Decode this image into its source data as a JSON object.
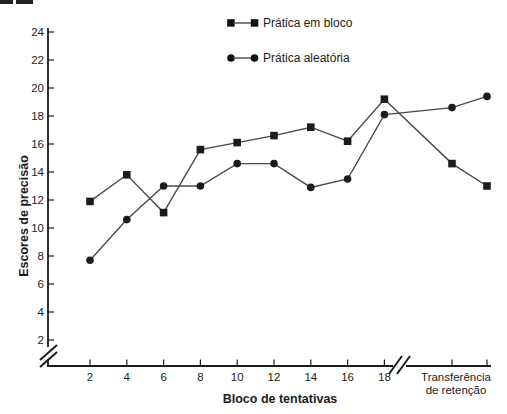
{
  "chart_data": {
    "type": "line",
    "title": "",
    "xlabel": "Bloco de tentativas",
    "ylabel": "Escores de precisão",
    "ylim": [
      2,
      24
    ],
    "grid": false,
    "legend_position": "top-center",
    "axis_breaks": {
      "y": "below 2 on y-axis",
      "x": "between block 18 and retention section"
    },
    "y_ticks": [
      2,
      4,
      6,
      8,
      10,
      12,
      14,
      16,
      18,
      20,
      22,
      24
    ],
    "x_tick_labels": [
      "2",
      "4",
      "6",
      "8",
      "10",
      "12",
      "14",
      "16",
      "18"
    ],
    "x_extra_label_lines": [
      "Transferência",
      "de retenção"
    ],
    "categories": [
      "2",
      "4",
      "6",
      "8",
      "10",
      "12",
      "14",
      "16",
      "18",
      "retenção 1",
      "retenção 2"
    ],
    "series": [
      {
        "name": "Prática em bloco",
        "marker": "square",
        "values": [
          11.9,
          13.8,
          11.1,
          15.6,
          16.1,
          16.6,
          17.2,
          16.2,
          19.2,
          14.6,
          13.0
        ]
      },
      {
        "name": "Prática aleatória",
        "marker": "circle",
        "values": [
          7.7,
          10.6,
          13.0,
          13.0,
          14.6,
          14.6,
          12.9,
          13.5,
          18.1,
          18.6,
          19.4
        ]
      }
    ],
    "colors": {
      "ink": "#1c1c1c",
      "line": "#4a4a4a",
      "background": "#ffffff"
    }
  }
}
